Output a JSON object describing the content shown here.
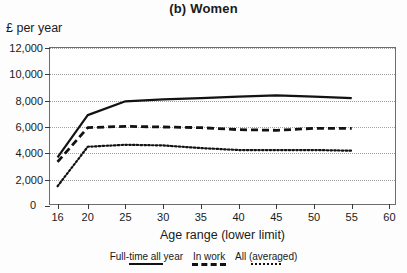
{
  "chart_data": {
    "type": "line",
    "title": "(b) Women",
    "ylabel": "£ per year",
    "xlabel": "Age range (lower limit)",
    "x": [
      16,
      20,
      25,
      30,
      35,
      40,
      45,
      50,
      55
    ],
    "xlim": [
      15,
      61
    ],
    "ylim": [
      0,
      12000
    ],
    "xticks": [
      16,
      20,
      25,
      30,
      35,
      40,
      45,
      50,
      55,
      60
    ],
    "xtick_labels": [
      "16",
      "20",
      "25",
      "30",
      "35",
      "40",
      "45",
      "50",
      "55",
      "60"
    ],
    "yticks": [
      0,
      2000,
      4000,
      6000,
      8000,
      10000,
      12000
    ],
    "ytick_labels": [
      "0",
      "2,000",
      "4,000",
      "6,000",
      "8,000",
      "10,000",
      "12,000"
    ],
    "grid": true,
    "legend_position": "below",
    "series": [
      {
        "name": "Full-time all year",
        "style": "solid",
        "color": "#121212",
        "values": [
          3700,
          6900,
          7950,
          8100,
          8200,
          8300,
          8400,
          8300,
          8200
        ]
      },
      {
        "name": "In work",
        "style": "dashed",
        "color": "#121212",
        "values": [
          3350,
          5950,
          6050,
          6000,
          5950,
          5800,
          5750,
          5900,
          5900
        ]
      },
      {
        "name": "All (averaged)",
        "style": "dotted",
        "color": "#121212",
        "values": [
          1500,
          4500,
          4650,
          4600,
          4400,
          4250,
          4250,
          4250,
          4200
        ]
      }
    ]
  },
  "title": "(b) Women",
  "axes": {
    "y_axis_title": "£ per year",
    "x_axis_title": "Age range (lower limit)",
    "zero_label": "0"
  },
  "legend": {
    "items": [
      {
        "label": "Full-time all year",
        "style": "solid"
      },
      {
        "label": "In work",
        "style": "dashed"
      },
      {
        "label": "All (averaged)",
        "style": "dotted"
      }
    ]
  }
}
